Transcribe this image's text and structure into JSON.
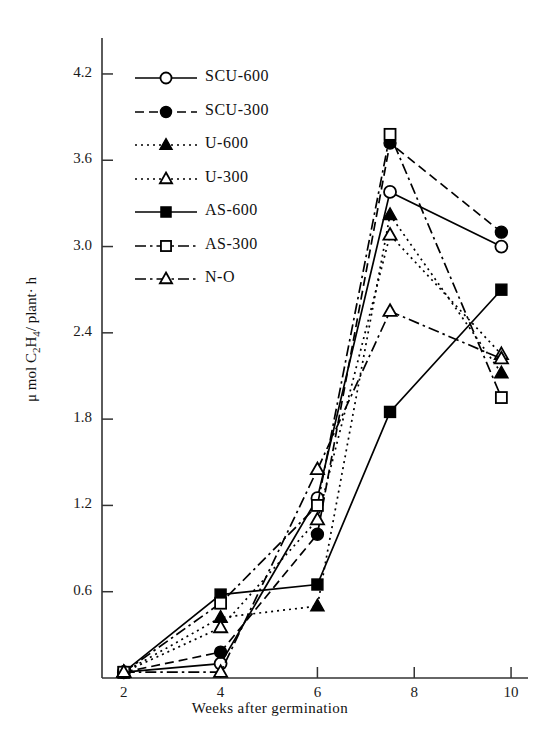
{
  "chart_data": {
    "type": "line",
    "title": "",
    "xlabel": "Weeks after germination",
    "ylabel": "μ mol C 2 H 4 / plant· h",
    "ylabel_parts": {
      "prefix": "μ mol C",
      "sub1": "2",
      "mid": "H",
      "sub2": "4",
      "suffix": "/ plant· h"
    },
    "x": [
      2,
      4,
      6,
      7.5,
      9.8
    ],
    "xlim": [
      1.55,
      10.35
    ],
    "ylim": [
      0,
      4.45
    ],
    "xticks": [
      2,
      4,
      6,
      8,
      10
    ],
    "xtick_labels": [
      "2",
      "4",
      "6",
      "8",
      "10"
    ],
    "yticks": [
      0.6,
      1.2,
      1.8,
      2.4,
      3.0,
      3.6,
      4.2
    ],
    "ytick_labels": [
      "0.6",
      "1.2",
      "1.8",
      "2.4",
      "3.0",
      "3.6",
      "4.2"
    ],
    "grid": false,
    "legend_position": "upper-left-inside",
    "series": [
      {
        "name": "SCU-600",
        "label": "SCU-600",
        "marker": "circle-open",
        "line": "solid",
        "values": [
          0.04,
          0.1,
          1.25,
          3.38,
          3.0
        ]
      },
      {
        "name": "SCU-300",
        "label": "SCU-300",
        "marker": "circle-filled",
        "line": "dashed",
        "values": [
          0.04,
          0.18,
          1.0,
          3.72,
          3.1
        ]
      },
      {
        "name": "U-600",
        "label": "U-600",
        "marker": "triangle-filled",
        "line": "dotted",
        "values": [
          0.04,
          0.42,
          0.5,
          3.22,
          2.12
        ]
      },
      {
        "name": "U-300",
        "label": "U-300",
        "marker": "triangle-open",
        "line": "dotted",
        "values": [
          0.04,
          0.35,
          1.1,
          3.08,
          2.25
        ]
      },
      {
        "name": "AS-600",
        "label": "AS-600",
        "marker": "square-filled",
        "line": "solid",
        "values": [
          0.04,
          0.58,
          0.65,
          1.85,
          2.7
        ]
      },
      {
        "name": "AS-300",
        "label": "AS-300",
        "marker": "square-open",
        "line": "dashdot",
        "values": [
          0.04,
          0.52,
          1.2,
          3.78,
          1.95
        ]
      },
      {
        "name": "N-O",
        "label": "N-O",
        "marker": "triangle-open",
        "line": "dashdot",
        "values": [
          0.04,
          0.04,
          1.45,
          2.55,
          2.22
        ]
      }
    ]
  }
}
